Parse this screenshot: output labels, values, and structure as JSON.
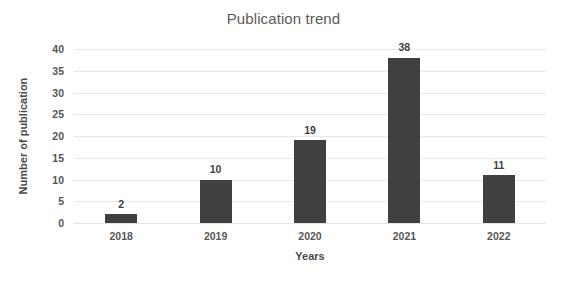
{
  "chart_data": {
    "type": "bar",
    "title": "Publication trend",
    "xlabel": "Years",
    "ylabel": "Number of publication",
    "categories": [
      "2018",
      "2019",
      "2020",
      "2021",
      "2022"
    ],
    "values": [
      2,
      10,
      19,
      38,
      11
    ],
    "data_labels": [
      "2",
      "10",
      "19",
      "38",
      "11"
    ],
    "ylim": [
      0,
      40
    ],
    "ytick_step": 5,
    "yticks": [
      0,
      5,
      10,
      15,
      20,
      25,
      30,
      35,
      40
    ],
    "ytick_labels": [
      "0",
      "5",
      "10",
      "15",
      "20",
      "25",
      "30",
      "35",
      "40"
    ],
    "grid": true,
    "grid_axis": "y",
    "legend": false,
    "legend_position": "none",
    "bar_color": "#404040",
    "gridline_color": "#e9e9e9",
    "background_color": "#ffffff",
    "title_color": "#5a5a5a",
    "tick_label_color": "#565656",
    "axis_title_color": "#4a4a4a"
  }
}
